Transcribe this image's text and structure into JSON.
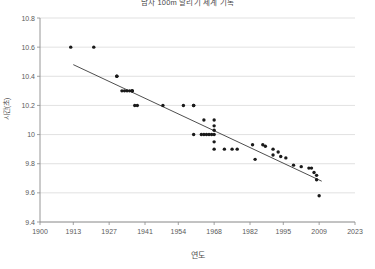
{
  "chart_data": {
    "type": "scatter",
    "title": "남자 100m 달리기 세계 기록",
    "xlabel": "연도",
    "ylabel": "시간(초)",
    "xlim": [
      1900,
      2023
    ],
    "ylim": [
      9.4,
      10.8
    ],
    "xticks": [
      1900,
      1913,
      1927,
      1941,
      1954,
      1968,
      1982,
      1995,
      2009,
      2023
    ],
    "xtick_labels": [
      "1900",
      "1913",
      "1927",
      "1941",
      "1954",
      "1968",
      "1982",
      "1995",
      "2009",
      "2023"
    ],
    "yticks": [
      9.4,
      9.6,
      9.8,
      10.0,
      10.2,
      10.4,
      10.6,
      10.8
    ],
    "ytick_labels": [
      "9.4",
      "9.6",
      "9.8",
      "10",
      "10.2",
      "10.4",
      "10.6",
      "10.8"
    ],
    "grid": true,
    "grid_axis": "y",
    "legend": false,
    "point_color": "#1a1a1a",
    "trend_color": "#3a3a3a",
    "grid_color": "#d9d9d9",
    "axis_color": "#8a8a8a",
    "background": "#ffffff",
    "series": [
      {
        "name": "세계 기록",
        "x": [
          1912,
          1921,
          1930,
          1930,
          1932,
          1933,
          1934,
          1935,
          1936,
          1936,
          1936,
          1937,
          1938,
          1948,
          1956,
          1960,
          1960,
          1964,
          1968,
          1968,
          1968,
          1960,
          1963,
          1964,
          1965,
          1966,
          1967,
          1968,
          1968,
          1968,
          1972,
          1975,
          1977,
          1983,
          1984,
          1987,
          1988,
          1991,
          1991,
          1993,
          1994,
          1996,
          1999,
          2002,
          2005,
          2006,
          2007,
          2008,
          2008,
          2009
        ],
        "y": [
          10.6,
          10.6,
          10.4,
          10.4,
          10.3,
          10.3,
          10.3,
          10.3,
          10.3,
          10.3,
          10.3,
          10.2,
          10.2,
          10.2,
          10.2,
          10.2,
          10.2,
          10.1,
          10.1,
          10.06,
          10.03,
          10.0,
          10.0,
          10.0,
          10.0,
          10.0,
          10.0,
          10.0,
          9.95,
          9.9,
          9.9,
          9.9,
          9.9,
          9.93,
          9.83,
          9.93,
          9.92,
          9.9,
          9.86,
          9.88,
          9.85,
          9.84,
          9.79,
          9.78,
          9.77,
          9.77,
          9.74,
          9.72,
          9.69,
          9.58
        ]
      }
    ],
    "trend": {
      "name": "추세선",
      "x_start": 1913,
      "y_start": 10.48,
      "x_end": 2010,
      "y_end": 9.68
    }
  }
}
